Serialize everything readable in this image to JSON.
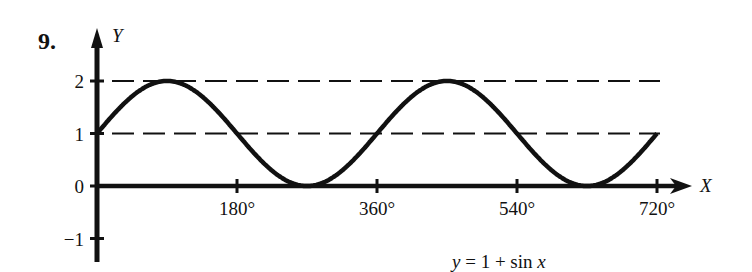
{
  "problem_number": "9.",
  "chart_data": {
    "type": "line",
    "title": "",
    "caption": "y = 1 + sin x",
    "xlabel": "X",
    "ylabel": "Y",
    "x_unit": "degrees",
    "xlim": [
      0,
      720
    ],
    "ylim": [
      -1,
      2
    ],
    "x_ticks": [
      180,
      360,
      540,
      720
    ],
    "x_tick_labels": [
      "180°",
      "360°",
      "540°",
      "720°"
    ],
    "y_ticks": [
      -1,
      0,
      1,
      2
    ],
    "y_tick_labels": [
      "−1",
      "0",
      "1",
      "2"
    ],
    "reference_lines": [
      {
        "y": 2,
        "style": "dashed"
      },
      {
        "y": 1,
        "style": "dashed"
      }
    ],
    "series": [
      {
        "name": "y = 1 + sin x",
        "x": [
          0,
          45,
          90,
          135,
          180,
          225,
          270,
          315,
          360,
          405,
          450,
          495,
          540,
          585,
          630,
          675,
          720
        ],
        "values": [
          1,
          1.71,
          2,
          1.71,
          1,
          0.29,
          0,
          0.29,
          1,
          1.71,
          2,
          1.71,
          1,
          0.29,
          0,
          0.29,
          1
        ]
      }
    ],
    "grid": false,
    "legend": null
  },
  "labels": {
    "x_axis": "X",
    "y_axis": "Y",
    "caption_y": "y",
    "caption_eq": " = 1 + sin ",
    "caption_x": "x"
  }
}
